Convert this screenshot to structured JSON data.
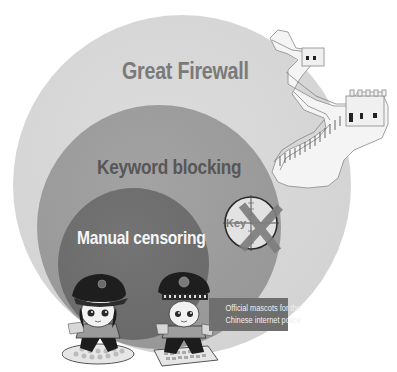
{
  "diagram": {
    "type": "nested-circles",
    "layers": [
      {
        "name": "outer",
        "label": "Great Firewall",
        "color": "#d6d6d6",
        "text_color": "#7a7a7a"
      },
      {
        "name": "middle",
        "label": "Keyword blocking",
        "color": "#9a9a9a",
        "text_color": "#575757"
      },
      {
        "name": "inner",
        "label": "Manual censoring",
        "color": "#6c6c6c",
        "text_color": "#f6f6f6"
      }
    ],
    "reticle": {
      "text": "Key"
    },
    "caption": {
      "line1": "Official mascots for the",
      "line2": "Chinese internet police",
      "bg_color": "#6f6f6f"
    },
    "icons": {
      "wall": "great-wall-illustration",
      "reticle": "crosshair-reticle-icon",
      "cross": "x-mark-icon",
      "mascot_left": "police-mascot-female",
      "mascot_right": "police-mascot-male"
    }
  }
}
